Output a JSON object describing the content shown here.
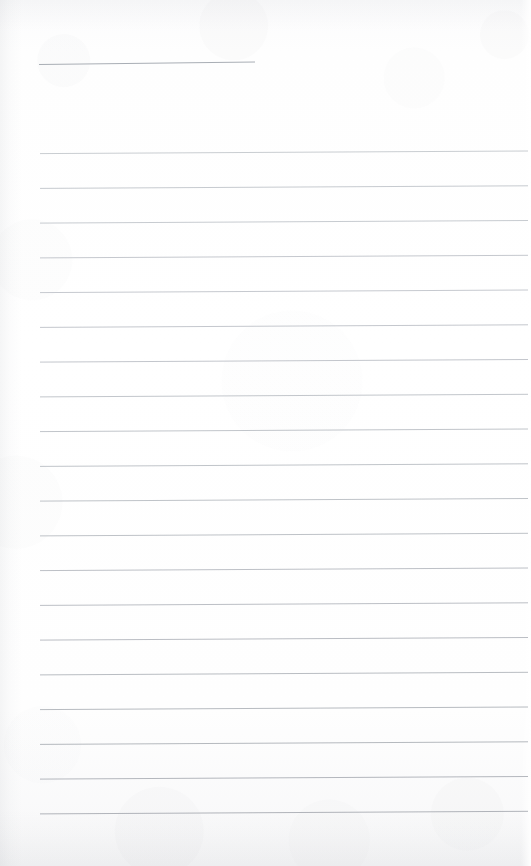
{
  "document": {
    "kind": "scanned-lined-paper",
    "description": "Blank ruled notebook page scan",
    "width": 531,
    "height": 866,
    "page_background_color": "#fdfdfd",
    "visible_text": ""
  },
  "header_rule": {
    "name": "header-rule",
    "label": "",
    "x_start": 39,
    "x_end": 255,
    "y_left": 64.5,
    "y_right": 62.0,
    "color": "#a9aeb5",
    "stroke_width": 1.0
  },
  "ruling": {
    "line_color": "#bcc1c7",
    "line_color_strong": "#a9aeb5",
    "x_start": 40,
    "x_end": 528,
    "stroke_width": 0.9,
    "first_line_y": 152.5,
    "line_spacing": 34.75,
    "line_count": 20,
    "tilt_rise_px": 2.6,
    "lines": [
      {
        "index": 1,
        "y_left": 153.6,
        "y_right": 151.0,
        "color": "#c3c7cc"
      },
      {
        "index": 2,
        "y_left": 188.4,
        "y_right": 185.8,
        "color": "#c0c4ca"
      },
      {
        "index": 3,
        "y_left": 223.1,
        "y_right": 220.5,
        "color": "#c1c5cb"
      },
      {
        "index": 4,
        "y_left": 257.9,
        "y_right": 255.3,
        "color": "#bec2c8"
      },
      {
        "index": 5,
        "y_left": 292.6,
        "y_right": 290.0,
        "color": "#bfc3c9"
      },
      {
        "index": 6,
        "y_left": 327.4,
        "y_right": 324.8,
        "color": "#bdc1c7"
      },
      {
        "index": 7,
        "y_left": 362.1,
        "y_right": 359.5,
        "color": "#bcc0c6"
      },
      {
        "index": 8,
        "y_left": 396.9,
        "y_right": 394.3,
        "color": "#bbbfc5"
      },
      {
        "index": 9,
        "y_left": 431.6,
        "y_right": 429.0,
        "color": "#babec4"
      },
      {
        "index": 10,
        "y_left": 466.4,
        "y_right": 463.8,
        "color": "#b9bdc3"
      },
      {
        "index": 11,
        "y_left": 501.1,
        "y_right": 498.5,
        "color": "#b8bcc2"
      },
      {
        "index": 12,
        "y_left": 535.9,
        "y_right": 533.3,
        "color": "#b7bbc1"
      },
      {
        "index": 13,
        "y_left": 570.6,
        "y_right": 568.0,
        "color": "#b5b9bf"
      },
      {
        "index": 14,
        "y_left": 605.4,
        "y_right": 602.8,
        "color": "#b4b8be"
      },
      {
        "index": 15,
        "y_left": 640.1,
        "y_right": 637.5,
        "color": "#b2b6bc"
      },
      {
        "index": 16,
        "y_left": 674.9,
        "y_right": 672.3,
        "color": "#b1b5bb"
      },
      {
        "index": 17,
        "y_left": 709.6,
        "y_right": 707.0,
        "color": "#afb3b9"
      },
      {
        "index": 18,
        "y_left": 744.4,
        "y_right": 741.8,
        "color": "#adb1b7"
      },
      {
        "index": 19,
        "y_left": 779.1,
        "y_right": 776.5,
        "color": "#abafb5"
      },
      {
        "index": 20,
        "y_left": 813.9,
        "y_right": 811.3,
        "color": "#a8acb2"
      }
    ]
  },
  "scan_artifacts": {
    "left_edge_shadow": "#8c929a",
    "bottom_edge_shadow": "#8c929a",
    "top_edge_shadow": "#8c929a",
    "grain_tint": "#969ba2"
  }
}
